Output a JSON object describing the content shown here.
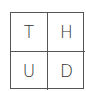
{
  "grid": {
    "cells": [
      {
        "label": "T"
      },
      {
        "label": "H"
      },
      {
        "label": "U"
      },
      {
        "label": "D"
      }
    ]
  }
}
